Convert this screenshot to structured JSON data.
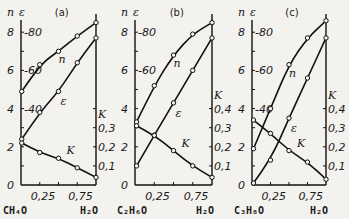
{
  "chart_data": [
    {
      "type": "line",
      "panel_label": "(a)",
      "xlabel_left": "CH4O",
      "xlabel_right": "H2O",
      "x_ticks": [
        "0,25",
        "0,75"
      ],
      "left_axis": {
        "symbols": [
          "n",
          "ε"
        ],
        "n_ticks": [
          "0",
          "2",
          "4",
          "6",
          "8"
        ],
        "eps_ticks": [
          "40",
          "60",
          "80"
        ],
        "ylim_n": [
          0,
          8.5
        ],
        "ylim_eps": [
          0,
          85
        ]
      },
      "right_axis": {
        "symbol": "K",
        "ticks": [
          "0,1",
          "0,2",
          "0,3"
        ]
      },
      "series": [
        {
          "name": "n",
          "x": [
            0.01,
            0.25,
            0.5,
            0.75,
            1.0
          ],
          "values": [
            4.9,
            6.3,
            7.0,
            7.8,
            8.5
          ]
        },
        {
          "name": "ε",
          "x": [
            0.01,
            0.25,
            0.5,
            0.75,
            1.0
          ],
          "values": [
            24,
            38,
            49,
            64,
            77
          ]
        },
        {
          "name": "K",
          "x": [
            0.01,
            0.25,
            0.5,
            0.75,
            1.0
          ],
          "values": [
            0.22,
            0.17,
            0.14,
            0.09,
            0.04
          ]
        }
      ]
    },
    {
      "type": "line",
      "panel_label": "(b)",
      "xlabel_left": "C2H6O",
      "xlabel_right": "H2O",
      "x_ticks": [
        "0,25",
        "0,75"
      ],
      "left_axis": {
        "symbols": [
          "n",
          "ε"
        ],
        "n_ticks": [
          "0",
          "2",
          "4",
          "6",
          "8"
        ],
        "eps_ticks": [
          "60",
          "80"
        ],
        "ylim_n": [
          0,
          8.5
        ],
        "ylim_eps": [
          0,
          85
        ]
      },
      "right_axis": {
        "symbol": "K",
        "ticks": [
          "0,1",
          "0,2",
          "0,3",
          "0,4"
        ]
      },
      "series": [
        {
          "name": "n",
          "x": [
            0.02,
            0.25,
            0.5,
            0.75,
            1.0
          ],
          "values": [
            3.3,
            5.2,
            6.8,
            7.9,
            8.5
          ]
        },
        {
          "name": "ε",
          "x": [
            0.02,
            0.25,
            0.5,
            0.75,
            1.0
          ],
          "values": [
            10,
            26,
            43,
            60,
            77
          ]
        },
        {
          "name": "K",
          "x": [
            0.02,
            0.25,
            0.5,
            0.75,
            1.0
          ],
          "values": [
            0.31,
            0.26,
            0.18,
            0.1,
            0.04
          ]
        }
      ]
    },
    {
      "type": "line",
      "panel_label": "(c)",
      "xlabel_left": "C3H8O",
      "xlabel_right": "H2O",
      "x_ticks": [
        "0,25",
        "0,75"
      ],
      "left_axis": {
        "symbols": [
          "n",
          "ε"
        ],
        "n_ticks": [
          "0",
          "2",
          "4",
          "6",
          "8"
        ],
        "eps_ticks": [
          "40",
          "60",
          "80"
        ],
        "ylim_n": [
          0,
          8.5
        ],
        "ylim_eps": [
          0,
          85
        ]
      },
      "right_axis": {
        "symbol": "K",
        "ticks": [
          "0,1",
          "0,2",
          "0,3",
          "0,4"
        ]
      },
      "series": [
        {
          "name": "n",
          "x": [
            0.02,
            0.25,
            0.5,
            0.75,
            1.0
          ],
          "values": [
            1.9,
            4.0,
            6.3,
            7.7,
            8.6
          ]
        },
        {
          "name": "ε",
          "x": [
            0.02,
            0.25,
            0.5,
            0.75,
            1.0
          ],
          "values": [
            1,
            13,
            35,
            56,
            77
          ]
        },
        {
          "name": "K",
          "x": [
            0.02,
            0.25,
            0.5,
            0.75,
            1.0
          ],
          "values": [
            0.34,
            0.27,
            0.18,
            0.12,
            0.03
          ]
        }
      ]
    }
  ],
  "panels": [
    {
      "label": "(a)",
      "comp_left": "CH₄O",
      "comp_right": "H₂O",
      "x_tick_1": "0,25",
      "x_tick_2": "0,75",
      "curve_n": "n",
      "curve_eps": "ε",
      "curve_k": "K",
      "sym_n": "n",
      "sym_eps": "ε",
      "sym_k": "K"
    },
    {
      "label": "(b)",
      "comp_left": "C₂H₆O",
      "comp_right": "H₂O",
      "x_tick_1": "0,25",
      "x_tick_2": "0,75",
      "curve_n": "n",
      "curve_eps": "ε",
      "curve_k": "K",
      "sym_n": "n",
      "sym_eps": "ε",
      "sym_k": "K"
    },
    {
      "label": "(c)",
      "comp_left": "C₃H₈O",
      "comp_right": "H₂O",
      "x_tick_1": "0,25",
      "x_tick_2": "0,75",
      "curve_n": "n",
      "curve_eps": "ε",
      "curve_k": "K",
      "sym_n": "n",
      "sym_eps": "ε",
      "sym_k": "K"
    }
  ],
  "n_tick_labels": [
    "0",
    "2",
    "4",
    "6",
    "8"
  ],
  "eps_tick_labels": {
    "40": "40",
    "60": "60",
    "80": "80"
  },
  "k_tick_labels": {
    "0.1": "0,1",
    "0.2": "0,2",
    "0.3": "0,3",
    "0.4": "0,4"
  }
}
